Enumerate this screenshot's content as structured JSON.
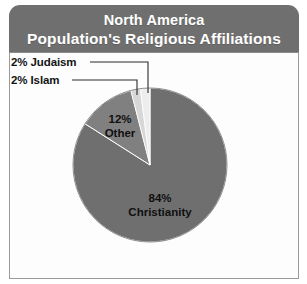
{
  "header": {
    "title_line1": "North America",
    "title_line2": "Population's Religious Affiliations",
    "background_color": "#6f6f6f",
    "text_color": "#ffffff"
  },
  "panel": {
    "background_color": "#fdfdfd",
    "border_color": "#9a9a9a"
  },
  "labels": {
    "judaism": "2% Judaism",
    "islam": "2% Islam",
    "other_percent": "12%",
    "other_name": "Other",
    "christianity_percent": "84%",
    "christianity_name": "Christianity"
  },
  "chart_data": {
    "type": "pie",
    "title": "North America Population's Religious Affiliations",
    "subtitle": "",
    "xlabel": "",
    "ylabel": "",
    "legend_position": "none",
    "grid": false,
    "value_unit": "percent",
    "start_angle_deg": 0,
    "direction": "clockwise",
    "center": {
      "x": 150,
      "y": 165
    },
    "radius": 77,
    "categories": [
      "Christianity",
      "Other",
      "Judaism",
      "Islam"
    ],
    "values": [
      84,
      12,
      2,
      2
    ],
    "labels": [
      "84% Christianity",
      "12% Other",
      "2% Judaism",
      "2% Islam"
    ],
    "colors": [
      "#6f6f6f",
      "#808080",
      "#d7d7d7",
      "#ededed"
    ],
    "slices": [
      {
        "name": "Christianity",
        "value": 84,
        "label": "84% Christianity",
        "color": "#6f6f6f",
        "label_placement": "inside"
      },
      {
        "name": "Other",
        "value": 12,
        "label": "12% Other",
        "color": "#808080",
        "label_placement": "inside"
      },
      {
        "name": "Judaism",
        "value": 2,
        "label": "2% Judaism",
        "color": "#d7d7d7",
        "label_placement": "callout-left"
      },
      {
        "name": "Islam",
        "value": 2,
        "label": "2% Islam",
        "color": "#ededed",
        "label_placement": "callout-left"
      }
    ],
    "total": 100
  }
}
